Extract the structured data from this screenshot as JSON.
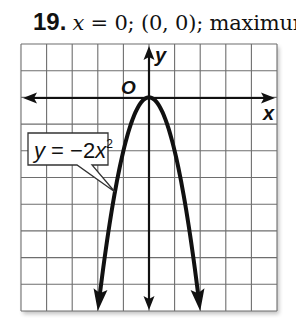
{
  "problem": {
    "number": "19.",
    "axis_of_symmetry": "x = 0",
    "axis_var": "x",
    "axis_rest": " = 0; ",
    "vertex": "(0, 0)",
    "vertex_text": "(0, 0); ",
    "type": "maximum"
  },
  "chart_data": {
    "type": "line",
    "function": "y = -2x^2",
    "annotation": "y = −2x²",
    "annotation_parts": {
      "lhs": "y",
      "eq": " = −2",
      "var": "x",
      "exp": "2"
    },
    "xlabel": "x",
    "ylabel": "y",
    "origin_label": "O",
    "xlim": [
      -5,
      5
    ],
    "ylim": [
      -8,
      2
    ],
    "grid": true,
    "grid_step": 1,
    "legend": "none",
    "vertex": [
      0,
      0
    ],
    "axis_of_symmetry": "x = 0",
    "extremum": "maximum",
    "series": [
      {
        "name": "y = -2x^2",
        "x": [
          -2,
          -1.5,
          -1,
          -0.5,
          0,
          0.5,
          1,
          1.5,
          2
        ],
        "y": [
          -8,
          -4.5,
          -2,
          -0.5,
          0,
          -0.5,
          -2,
          -4.5,
          -8
        ]
      }
    ],
    "colors": {
      "grid": "#6e6e6e",
      "axes": "#111111",
      "curve": "#111111",
      "background": "#ffffff"
    }
  }
}
